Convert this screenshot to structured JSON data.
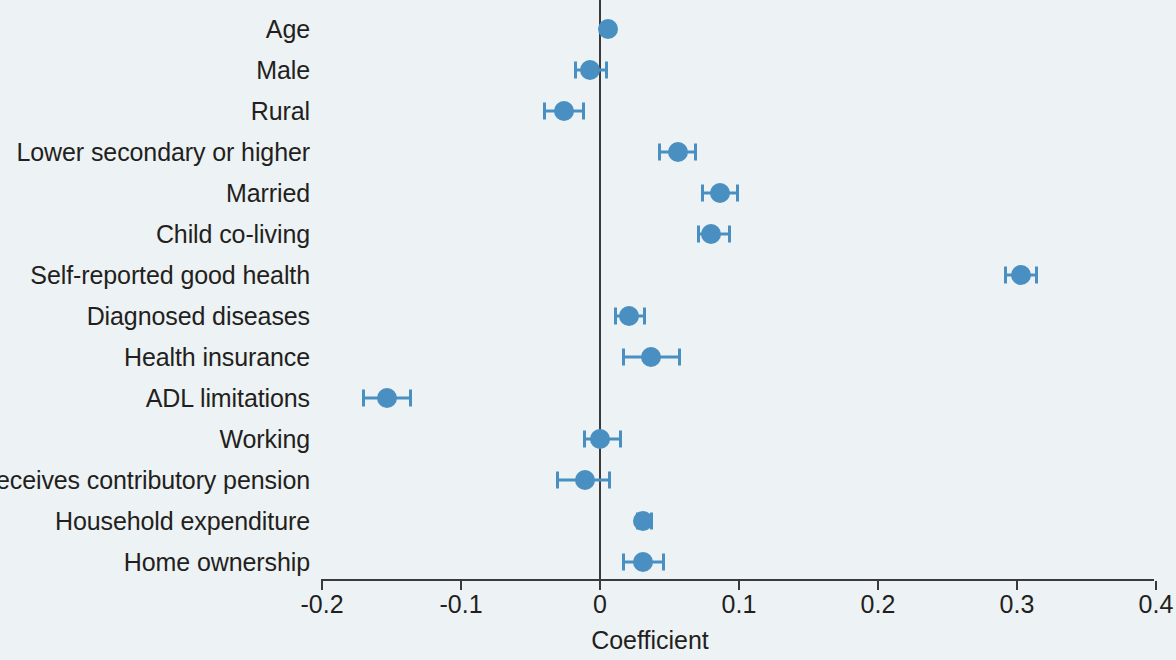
{
  "chart_data": {
    "type": "scatter",
    "subtype": "coefficient-plot-with-error-bars",
    "title": "",
    "xlabel": "Coefficient",
    "ylabel": "",
    "xlim": [
      -0.2,
      0.4
    ],
    "xticks": [
      -0.2,
      -0.1,
      0,
      0.1,
      0.2,
      0.3,
      0.4
    ],
    "xtick_labels": [
      "-0.2",
      "-0.1",
      "0",
      "0.1",
      "0.2",
      "0.3",
      "0.4"
    ],
    "grid": false,
    "legend": null,
    "reference_line": 0,
    "marker_color": "#4a8fc2",
    "axis_color": "#3a3a3c",
    "background_color": "#edf2f4",
    "categories": [
      "Age",
      "Male",
      "Rural",
      "Lower secondary or higher",
      "Married",
      "Child co-living",
      "Self-reported good health",
      "Diagnosed diseases",
      "Health insurance",
      "ADL limitations",
      "Working",
      "Receives contributory pension",
      "Household expenditure",
      "Home ownership"
    ],
    "points": [
      {
        "label": "Age",
        "value": 0.006,
        "ci_low": 0.003,
        "ci_high": 0.009
      },
      {
        "label": "Male",
        "value": -0.007,
        "ci_low": -0.019,
        "ci_high": 0.006
      },
      {
        "label": "Rural",
        "value": -0.026,
        "ci_low": -0.041,
        "ci_high": -0.011
      },
      {
        "label": "Lower secondary or higher",
        "value": 0.056,
        "ci_low": 0.042,
        "ci_high": 0.07
      },
      {
        "label": "Married",
        "value": 0.086,
        "ci_low": 0.073,
        "ci_high": 0.1
      },
      {
        "label": "Child co-living",
        "value": 0.08,
        "ci_low": 0.07,
        "ci_high": 0.094
      },
      {
        "label": "Self-reported good health",
        "value": 0.303,
        "ci_low": 0.291,
        "ci_high": 0.315
      },
      {
        "label": "Diagnosed diseases",
        "value": 0.021,
        "ci_low": 0.01,
        "ci_high": 0.033
      },
      {
        "label": "Health insurance",
        "value": 0.037,
        "ci_low": 0.016,
        "ci_high": 0.058
      },
      {
        "label": "ADL limitations",
        "value": -0.153,
        "ci_low": -0.171,
        "ci_high": -0.135
      },
      {
        "label": "Working",
        "value": 0.0,
        "ci_low": -0.012,
        "ci_high": 0.016
      },
      {
        "label": "Receives contributory pension",
        "value": -0.011,
        "ci_low": -0.032,
        "ci_high": 0.008
      },
      {
        "label": "Household expenditure",
        "value": 0.031,
        "ci_low": 0.026,
        "ci_high": 0.038
      },
      {
        "label": "Home ownership",
        "value": 0.031,
        "ci_low": 0.016,
        "ci_high": 0.047
      }
    ]
  },
  "layout": {
    "x_of_zero_px": 600,
    "px_per_unit": 1390,
    "first_row_y_px": 29,
    "row_step_px": 41,
    "axis_baseline_y_px": 580,
    "axis_left_px": 321,
    "axis_right_px": 1154
  }
}
